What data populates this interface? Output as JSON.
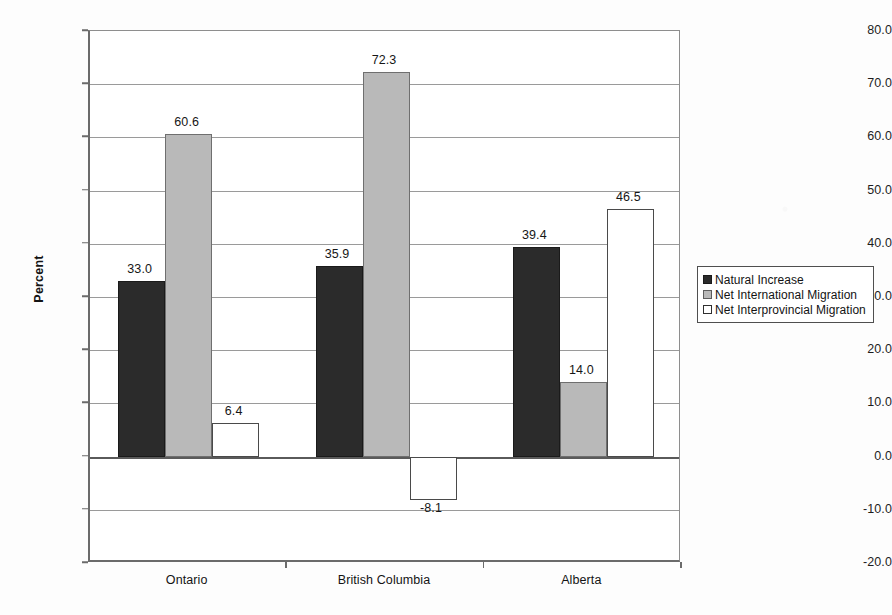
{
  "chart_data": {
    "type": "bar",
    "title": "",
    "xlabel": "",
    "ylabel": "Percent",
    "ylim": [
      -20.0,
      80.0
    ],
    "ytick_step": 10.0,
    "grid": true,
    "legend_position": "right",
    "categories": [
      "Ontario",
      "British Columbia",
      "Alberta"
    ],
    "ytick_labels": [
      "80.0",
      "70.0",
      "60.0",
      "50.0",
      "40.0",
      "30.0",
      "20.0",
      "10.0",
      "0.0",
      "-10.0",
      "-20.0"
    ],
    "ytick_values": [
      80.0,
      70.0,
      60.0,
      50.0,
      40.0,
      30.0,
      20.0,
      10.0,
      0.0,
      -10.0,
      -20.0
    ],
    "series": [
      {
        "name": "Natural Increase",
        "swatch": "dark",
        "color": "#2b2b2b",
        "values": [
          33.0,
          35.9,
          39.4
        ],
        "labels": [
          "33.0",
          "35.9",
          "39.4"
        ]
      },
      {
        "name": "Net International Migration",
        "swatch": "gray",
        "color": "#b9b9b9",
        "values": [
          60.6,
          72.3,
          14.0
        ],
        "labels": [
          "60.6",
          "72.3",
          "14.0"
        ]
      },
      {
        "name": "Net Interprovincial Migration",
        "swatch": "white",
        "color": "#ffffff",
        "values": [
          6.4,
          -8.1,
          46.5
        ],
        "labels": [
          "6.4",
          "-8.1",
          "46.5"
        ]
      }
    ]
  }
}
